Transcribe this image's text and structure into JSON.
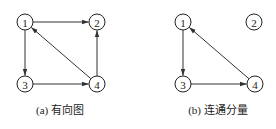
{
  "diagrams": [
    {
      "id": "a",
      "caption": "(a) 有向图",
      "nodes": [
        {
          "label": "1",
          "x": 25,
          "y": 22
        },
        {
          "label": "2",
          "x": 97,
          "y": 22
        },
        {
          "label": "3",
          "x": 25,
          "y": 84
        },
        {
          "label": "4",
          "x": 97,
          "y": 84
        }
      ],
      "edges": [
        {
          "from": "1",
          "to": "2"
        },
        {
          "from": "1",
          "to": "3"
        },
        {
          "from": "3",
          "to": "4"
        },
        {
          "from": "4",
          "to": "2"
        },
        {
          "from": "4",
          "to": "1"
        }
      ]
    },
    {
      "id": "b",
      "caption": "(b) 连通分量",
      "nodes": [
        {
          "label": "1",
          "x": 183,
          "y": 22
        },
        {
          "label": "2",
          "x": 254,
          "y": 22
        },
        {
          "label": "3",
          "x": 183,
          "y": 84
        },
        {
          "label": "4",
          "x": 255,
          "y": 84
        }
      ],
      "edges": [
        {
          "from": "1",
          "to": "3"
        },
        {
          "from": "3",
          "to": "4"
        },
        {
          "from": "4",
          "to": "1"
        }
      ]
    }
  ]
}
